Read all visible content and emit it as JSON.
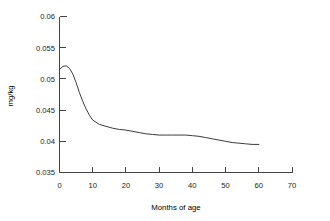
{
  "chart_data": {
    "type": "line",
    "title": "",
    "xlabel": "Months of age",
    "ylabel": "mg/kg",
    "xlim": [
      0,
      70
    ],
    "ylim": [
      0.035,
      0.06
    ],
    "grid": false,
    "legend": null,
    "xticks": [
      0,
      10,
      20,
      30,
      40,
      50,
      60,
      70
    ],
    "xtick_labels": [
      "0",
      "10",
      "20",
      "30",
      "40",
      "50",
      "60",
      "70"
    ],
    "yticks": [
      0.035,
      0.04,
      0.045,
      0.05,
      0.055,
      0.06
    ],
    "ytick_labels": [
      "0.035",
      "0.04",
      "0.045",
      "0.05",
      "0.055",
      "0.06"
    ],
    "line_color": "#3b3b3b",
    "series": [
      {
        "name": "dose",
        "x": [
          0,
          1,
          2,
          3,
          4,
          5,
          6,
          7,
          8,
          9,
          10,
          12,
          14,
          16,
          18,
          20,
          22,
          24,
          26,
          28,
          30,
          32,
          34,
          36,
          38,
          40,
          42,
          44,
          46,
          48,
          50,
          52,
          54,
          56,
          58,
          60
        ],
        "values": [
          0.0515,
          0.052,
          0.0521,
          0.0517,
          0.0508,
          0.0494,
          0.0478,
          0.0464,
          0.0452,
          0.0442,
          0.0434,
          0.0427,
          0.0424,
          0.0421,
          0.0419,
          0.0418,
          0.0416,
          0.0414,
          0.0412,
          0.0411,
          0.041,
          0.041,
          0.041,
          0.041,
          0.041,
          0.0409,
          0.0408,
          0.0406,
          0.0404,
          0.0402,
          0.04,
          0.0398,
          0.0397,
          0.0396,
          0.0395,
          0.0395
        ]
      }
    ]
  },
  "ytick_labels": {
    "t0": "0.06",
    "t1": "0.055",
    "t2": "0.05",
    "t3": "0.045",
    "t4": "0.04",
    "t5": "0.035"
  },
  "xtick_labels": {
    "t0": "0",
    "t1": "10",
    "t2": "20",
    "t3": "30",
    "t4": "40",
    "t5": "50",
    "t6": "60",
    "t7": "70"
  },
  "labels": {
    "x_axis_title": "Months of age",
    "y_axis_title": "mg/kg"
  }
}
